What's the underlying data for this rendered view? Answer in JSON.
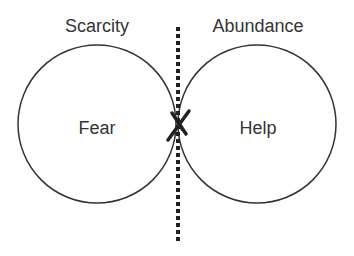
{
  "diagram": {
    "left_header": "Scarcity",
    "right_header": "Abundance",
    "left_circle_label": "Fear",
    "right_circle_label": "Help",
    "divider_style": "dotted",
    "crossing_mark": "X",
    "colors": {
      "stroke": "#333333",
      "text": "#333333",
      "background": "#ffffff"
    }
  }
}
